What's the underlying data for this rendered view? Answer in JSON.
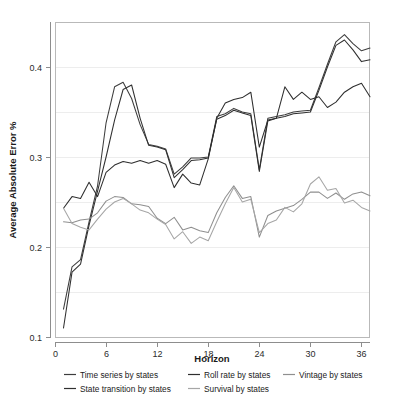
{
  "chart_data": {
    "type": "line",
    "title": "",
    "xlabel": "Horizon",
    "ylabel": "Average Absolute Error %",
    "xlim": [
      0,
      37
    ],
    "ylim": [
      0.1,
      0.45
    ],
    "xticks": [
      0,
      6,
      12,
      18,
      24,
      30,
      36
    ],
    "xtick_labels": [
      "0",
      "6",
      "12",
      "18",
      "24",
      "30",
      "36"
    ],
    "yticks": [
      0.1,
      0.2,
      0.3,
      0.4
    ],
    "ytick_labels": [
      "0.1",
      "0.2",
      "0.3",
      "0.4"
    ],
    "grid": true,
    "grid_axis": "y",
    "legend_position": "below",
    "x": [
      1,
      2,
      3,
      4,
      5,
      6,
      7,
      8,
      9,
      10,
      11,
      12,
      13,
      14,
      15,
      16,
      17,
      18,
      19,
      20,
      21,
      22,
      23,
      24,
      25,
      26,
      27,
      28,
      29,
      30,
      31,
      32,
      33,
      34,
      35,
      36,
      37
    ],
    "series": [
      {
        "name": "Time series by states",
        "color": "#3d3d3d",
        "values": [
          0.131,
          0.178,
          0.186,
          0.228,
          0.268,
          0.338,
          0.378,
          0.383,
          0.365,
          0.336,
          0.314,
          0.312,
          0.309,
          0.281,
          0.289,
          0.299,
          0.299,
          0.3,
          0.345,
          0.348,
          0.354,
          0.35,
          0.348,
          0.286,
          0.343,
          0.345,
          0.347,
          0.35,
          0.351,
          0.352,
          0.377,
          0.403,
          0.428,
          0.436,
          0.426,
          0.418,
          0.421
        ]
      },
      {
        "name": "State transition by states",
        "color": "#303030",
        "values": [
          0.11,
          0.172,
          0.181,
          0.224,
          0.262,
          0.3,
          0.341,
          0.375,
          0.38,
          0.343,
          0.313,
          0.311,
          0.308,
          0.277,
          0.286,
          0.296,
          0.297,
          0.299,
          0.342,
          0.346,
          0.352,
          0.349,
          0.346,
          0.284,
          0.34,
          0.343,
          0.345,
          0.348,
          0.349,
          0.35,
          0.374,
          0.4,
          0.424,
          0.43,
          0.419,
          0.406,
          0.408
        ]
      },
      {
        "name": "Roll rate by states",
        "color": "#2e2e2e",
        "values": [
          0.243,
          0.256,
          0.254,
          0.272,
          0.256,
          0.283,
          0.291,
          0.295,
          0.293,
          0.296,
          0.293,
          0.296,
          0.292,
          0.266,
          0.281,
          0.271,
          0.269,
          0.298,
          0.343,
          0.36,
          0.364,
          0.366,
          0.372,
          0.311,
          0.341,
          0.343,
          0.378,
          0.364,
          0.372,
          0.364,
          0.367,
          0.355,
          0.361,
          0.372,
          0.378,
          0.382,
          0.367
        ]
      },
      {
        "name": "Vintage by states",
        "color": "#8f8f8f",
        "values": [
          0.228,
          0.227,
          0.23,
          0.231,
          0.238,
          0.251,
          0.256,
          0.255,
          0.248,
          0.247,
          0.245,
          0.232,
          0.226,
          0.233,
          0.219,
          0.222,
          0.218,
          0.216,
          0.238,
          0.255,
          0.268,
          0.254,
          0.256,
          0.211,
          0.235,
          0.24,
          0.243,
          0.246,
          0.253,
          0.261,
          0.261,
          0.254,
          0.26,
          0.253,
          0.259,
          0.261,
          0.257
        ]
      },
      {
        "name": "Survival by states",
        "color": "#a6a6a6",
        "values": [
          0.243,
          0.226,
          0.222,
          0.219,
          0.231,
          0.242,
          0.25,
          0.254,
          0.248,
          0.241,
          0.238,
          0.231,
          0.225,
          0.209,
          0.217,
          0.204,
          0.211,
          0.207,
          0.228,
          0.248,
          0.266,
          0.25,
          0.253,
          0.216,
          0.226,
          0.23,
          0.244,
          0.239,
          0.248,
          0.27,
          0.278,
          0.263,
          0.265,
          0.249,
          0.252,
          0.244,
          0.24
        ]
      }
    ]
  },
  "legend": {
    "items": [
      {
        "label": "Time series by states",
        "color": "#3d3d3d"
      },
      {
        "label": "Roll rate by states",
        "color": "#2e2e2e"
      },
      {
        "label": "Vintage by states",
        "color": "#8f8f8f"
      },
      {
        "label": "State transition by states",
        "color": "#303030"
      },
      {
        "label": "Survival by states",
        "color": "#a6a6a6"
      }
    ]
  },
  "colors": {
    "background": "#ffffff",
    "gridline": "#ededed",
    "axis": "#8d8d8d",
    "border": "#b9b9b9",
    "text": "#1a1a1a"
  }
}
